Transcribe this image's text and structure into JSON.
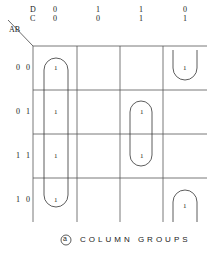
{
  "kmap": {
    "row_var": "AB",
    "col_vars": [
      "D",
      "C"
    ],
    "col_headers": [
      {
        "D": "0",
        "C": "0"
      },
      {
        "D": "1",
        "C": "0"
      },
      {
        "D": "1",
        "C": "1"
      },
      {
        "D": "0",
        "C": "1"
      }
    ],
    "row_labels": [
      "0 0",
      "0 1",
      "1 1",
      "1 0"
    ],
    "cells": [
      [
        "1",
        "",
        "",
        "1"
      ],
      [
        "1",
        "",
        "1",
        ""
      ],
      [
        "1",
        "",
        "1",
        ""
      ],
      [
        "1",
        "",
        "",
        "1"
      ]
    ],
    "groups": [
      {
        "name": "column-1-group",
        "col": 0,
        "rows": [
          0,
          3
        ]
      },
      {
        "name": "column-3-group",
        "col": 2,
        "rows": [
          1,
          2
        ]
      },
      {
        "name": "column-4-wrap-group",
        "col": 3,
        "rows": [
          0,
          3
        ],
        "wraps": true
      }
    ]
  },
  "caption": {
    "marker": "a",
    "text": "COLUMN GROUPS"
  }
}
